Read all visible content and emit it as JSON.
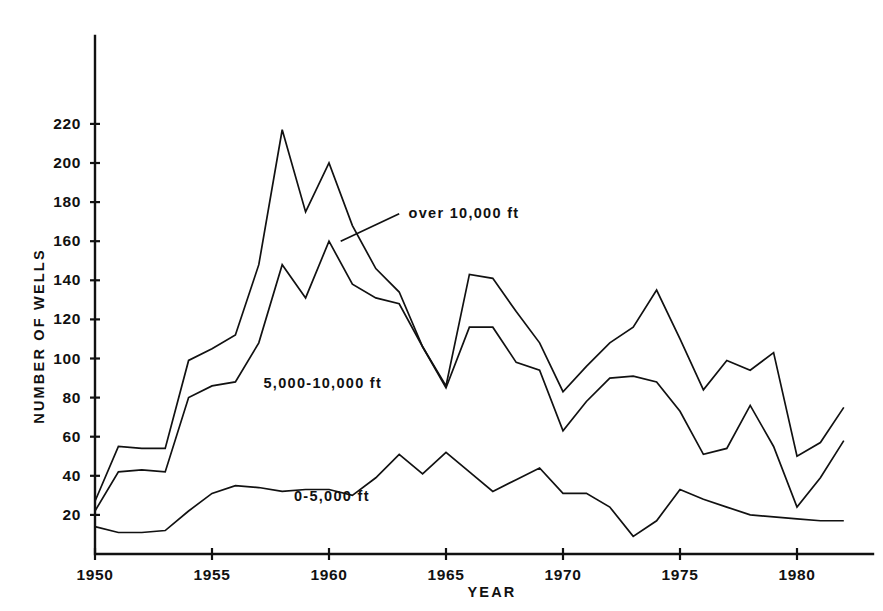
{
  "figure": {
    "background_color": "#ffffff",
    "ink_color": "#111111"
  },
  "chart_data": {
    "type": "line",
    "title": "",
    "subtitle": "",
    "xlabel": "YEAR",
    "ylabel": "NUMBER OF WELLS",
    "xlim": [
      1950,
      1982
    ],
    "ylim": [
      0,
      232
    ],
    "grid": false,
    "legend_position": "inline-annotations",
    "x_tick_labels": [
      "1950",
      "1955",
      "1960",
      "1965",
      "1970",
      "1975",
      "1980"
    ],
    "x_ticks": [
      1950,
      1955,
      1960,
      1965,
      1970,
      1975,
      1980
    ],
    "y_tick_labels": [
      "20",
      "40",
      "60",
      "80",
      "100",
      "120",
      "140",
      "160",
      "180",
      "200",
      "220"
    ],
    "y_ticks": [
      20,
      40,
      60,
      80,
      100,
      120,
      140,
      160,
      180,
      200,
      220
    ],
    "x": [
      1950,
      1951,
      1952,
      1953,
      1954,
      1955,
      1956,
      1957,
      1958,
      1959,
      1960,
      1961,
      1962,
      1963,
      1964,
      1965,
      1966,
      1967,
      1968,
      1969,
      1970,
      1971,
      1972,
      1973,
      1974,
      1975,
      1976,
      1977,
      1978,
      1979,
      1980,
      1981,
      1982
    ],
    "series": [
      {
        "name": "over 10,000 ft",
        "label": "over 10,000 ft",
        "values": [
          27,
          55,
          54,
          54,
          99,
          105,
          112,
          148,
          217,
          175,
          200,
          168,
          146,
          134,
          106,
          86,
          143,
          141,
          124,
          108,
          83,
          96,
          108,
          116,
          135,
          110,
          84,
          99,
          94,
          103,
          50,
          57,
          75
        ]
      },
      {
        "name": "5,000-10,000 ft",
        "label": "5,000-10,000 ft",
        "values": [
          22,
          42,
          43,
          42,
          80,
          86,
          88,
          108,
          148,
          131,
          160,
          138,
          131,
          128,
          106,
          85,
          116,
          116,
          98,
          94,
          63,
          78,
          90,
          91,
          88,
          73,
          51,
          54,
          76,
          55,
          24,
          39,
          58
        ]
      },
      {
        "name": "0-5,000 ft",
        "label": "0-5,000 ft",
        "values": [
          14,
          11,
          11,
          12,
          22,
          31,
          35,
          34,
          32,
          33,
          33,
          30,
          39,
          51,
          41,
          52,
          42,
          32,
          38,
          44,
          31,
          31,
          24,
          9,
          17,
          33,
          28,
          24,
          20,
          19,
          18,
          17,
          17
        ]
      }
    ],
    "annotations": [
      {
        "text": "over 10,000 ft",
        "x_value": 1963.4,
        "y_value": 172,
        "leader_from": [
          1960.5,
          160
        ],
        "leader_to": [
          1963.0,
          174
        ]
      },
      {
        "text": "5,000-10,000 ft",
        "x_value": 1957.2,
        "y_value": 85,
        "leader_from": null,
        "leader_to": null
      },
      {
        "text": "0-5,000 ft",
        "x_value": 1958.5,
        "y_value": 27,
        "leader_from": null,
        "leader_to": null
      }
    ]
  }
}
